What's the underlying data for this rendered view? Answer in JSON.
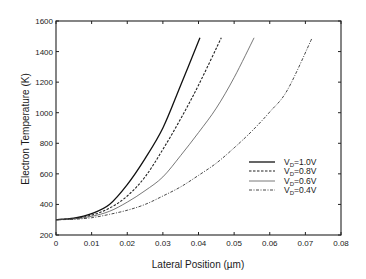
{
  "chart_data": {
    "type": "line",
    "title": "",
    "xlabel": "Lateral Position (µm)",
    "ylabel": "Electron Temperature (K)",
    "xlim": [
      0,
      0.08
    ],
    "ylim": [
      200,
      1600
    ],
    "x_ticks": [
      "0",
      "0.01",
      "0.02",
      "0.03",
      "0.04",
      "0.05",
      "0.06",
      "0.07",
      "0.08"
    ],
    "y_ticks": [
      "200",
      "400",
      "600",
      "800",
      "1000",
      "1200",
      "1400",
      "1600"
    ],
    "grid": false,
    "legend_position": "center-right",
    "series": [
      {
        "name": "VD=1.0V",
        "label_main": "V",
        "label_sub": "D",
        "label_rest": "=1.0V",
        "style": "solid",
        "x": [
          0,
          0.005,
          0.01,
          0.015,
          0.02,
          0.025,
          0.03,
          0.035,
          0.0404
        ],
        "y": [
          300,
          310,
          340,
          400,
          530,
          700,
          900,
          1180,
          1490
        ]
      },
      {
        "name": "VD=0.8V",
        "label_main": "V",
        "label_sub": "D",
        "label_rest": "=0.8V",
        "style": "dashed",
        "x": [
          0,
          0.005,
          0.01,
          0.015,
          0.02,
          0.025,
          0.03,
          0.035,
          0.04,
          0.0464
        ],
        "y": [
          300,
          308,
          330,
          375,
          455,
          580,
          760,
          960,
          1180,
          1490
        ]
      },
      {
        "name": "VD=0.6V",
        "label_main": "V",
        "label_sub": "D",
        "label_rest": "=0.6V",
        "style": "dotted",
        "x": [
          0,
          0.005,
          0.01,
          0.015,
          0.02,
          0.025,
          0.03,
          0.035,
          0.04,
          0.045,
          0.05,
          0.0556
        ],
        "y": [
          300,
          305,
          322,
          355,
          415,
          490,
          580,
          720,
          870,
          1030,
          1230,
          1490
        ]
      },
      {
        "name": "VD=0.4V",
        "label_main": "V",
        "label_sub": "D",
        "label_rest": "=0.4V",
        "style": "dashdot",
        "x": [
          0,
          0.005,
          0.01,
          0.015,
          0.02,
          0.025,
          0.03,
          0.035,
          0.04,
          0.045,
          0.05,
          0.055,
          0.06,
          0.065,
          0.0719
        ],
        "y": [
          300,
          303,
          313,
          335,
          362,
          400,
          455,
          515,
          590,
          670,
          770,
          880,
          1005,
          1150,
          1490
        ]
      }
    ]
  }
}
